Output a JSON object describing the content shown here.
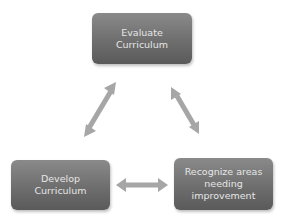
{
  "diagram": {
    "type": "cycle",
    "nodes": [
      {
        "id": "top",
        "lines": [
          "Evaluate",
          "Curriculum"
        ]
      },
      {
        "id": "right",
        "lines": [
          "Recognize areas",
          "needing",
          "improvement"
        ]
      },
      {
        "id": "left",
        "lines": [
          "Develop",
          "Curriculum"
        ]
      }
    ],
    "connectors": [
      {
        "from": "top",
        "to": "left",
        "style": "double-arrow"
      },
      {
        "from": "top",
        "to": "right",
        "style": "double-arrow"
      },
      {
        "from": "left",
        "to": "right",
        "style": "double-arrow"
      }
    ],
    "colors": {
      "node_fill_top": "#8a8a8a",
      "node_fill_bottom": "#5a5a5a",
      "node_text": "#e6e6e6",
      "arrow": "#a6a6a6",
      "background": "#ffffff"
    }
  }
}
